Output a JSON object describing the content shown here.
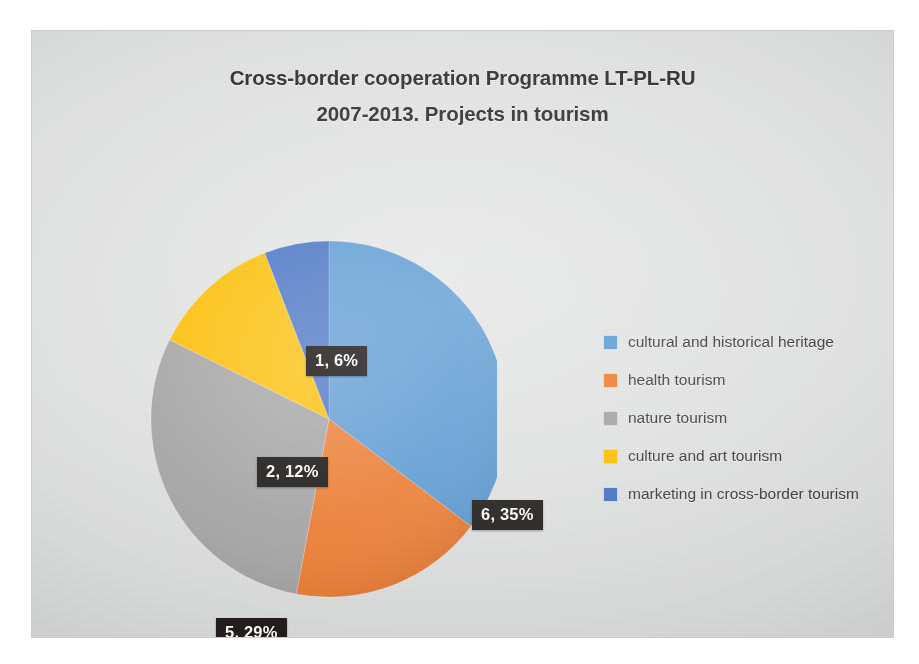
{
  "slide": {
    "background_color": "#e2e3e3",
    "page_color": "#ffffff"
  },
  "title": {
    "line1": "Cross-border cooperation Programme LT-PL-RU",
    "line2": "2007-2013. Projects in tourism"
  },
  "chart_data": {
    "type": "pie",
    "title": "Cross-border cooperation Programme LT-PL-RU 2007-2013. Projects in tourism",
    "xlabel": "",
    "ylabel": "",
    "legend_position": "right",
    "grid": false,
    "start_angle_deg": 0,
    "direction": "clockwise",
    "categories": [
      "cultural and historical heritage",
      "health tourism",
      "nature tourism",
      "culture and art tourism",
      "marketing in cross-border tourism"
    ],
    "values": [
      6,
      3,
      5,
      2,
      1
    ],
    "percentages": [
      35,
      18,
      29,
      12,
      6
    ],
    "total": 17,
    "colors": [
      "#5B9BD5",
      "#ED7D31",
      "#A5A5A5",
      "#FFC000",
      "#4472C4"
    ],
    "data_labels": [
      "6, 35%",
      "3, 18%",
      "5, 29%",
      "2, 12%",
      "1, 6%"
    ],
    "slices": [
      {
        "label": "cultural and historical heritage",
        "value": 6,
        "percent": 35,
        "color": "#5B9BD5",
        "data_label": "6, 35%"
      },
      {
        "label": "health tourism",
        "value": 3,
        "percent": 18,
        "color": "#ED7D31",
        "data_label": "3, 18%"
      },
      {
        "label": "nature tourism",
        "value": 5,
        "percent": 29,
        "color": "#A5A5A5",
        "data_label": "5, 29%"
      },
      {
        "label": "culture and art tourism",
        "value": 2,
        "percent": 12,
        "color": "#FFC000",
        "data_label": "2, 12%"
      },
      {
        "label": "marketing in cross-border tourism",
        "value": 1,
        "percent": 6,
        "color": "#4472C4",
        "data_label": "1, 6%"
      }
    ]
  },
  "legend": {
    "items": [
      {
        "label": "cultural and historical heritage",
        "color": "#5B9BD5"
      },
      {
        "label": "health tourism",
        "color": "#ED7D31"
      },
      {
        "label": "nature tourism",
        "color": "#A5A5A5"
      },
      {
        "label": "culture and art tourism",
        "color": "#FFC000"
      },
      {
        "label": "marketing in cross-border tourism",
        "color": "#4472C4"
      }
    ]
  }
}
